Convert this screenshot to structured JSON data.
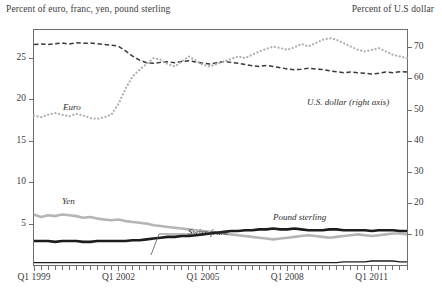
{
  "header": {
    "left_label": "Percent of euro, franc, yen, pound sterling",
    "right_label": "Percent of U.S dollar"
  },
  "axes": {
    "left_ticks": [
      "5",
      "10",
      "15",
      "20",
      "25"
    ],
    "right_ticks": [
      "10",
      "20",
      "30",
      "40",
      "50",
      "60",
      "70"
    ],
    "x_ticks": [
      "Q1 1999",
      "Q1 2002",
      "Q1 2005",
      "Q1 2008",
      "Q1 2011"
    ]
  },
  "annotations": {
    "euro": "Euro",
    "usd": "U.S. dollar (right axis)",
    "yen": "Yen",
    "swiss_franc": "Swiss franc",
    "pound_sterling": "Pound sterling"
  },
  "colors": {
    "usd": "#3a3a3a",
    "euro": "#b0b0b0",
    "yen": "#b5b5b5",
    "pound": "#1c1c1c",
    "franc": "#1c1c1c",
    "frame": "#6e6e6e",
    "text": "#3c3c3c",
    "background": "#ffffff"
  },
  "chart_data": {
    "type": "line",
    "title": "",
    "subtitle": "",
    "xlabel": "",
    "ylabel": "Percent of euro, franc, yen, pound sterling",
    "y2label": "Percent of U.S dollar",
    "grid": false,
    "legend": "inline-annotations",
    "ylim": [
      0,
      28.5
    ],
    "y2lim": [
      0,
      76
    ],
    "yticks": [
      5,
      10,
      15,
      20,
      25
    ],
    "y2ticks": [
      10,
      20,
      30,
      40,
      50,
      60,
      70
    ],
    "xlim": [
      "1999Q1",
      "2012Q2"
    ],
    "x_tick_labels": [
      "Q1 1999",
      "Q1 2002",
      "Q1 2005",
      "Q1 2008",
      "Q1 2011"
    ],
    "x_tick_positions": [
      "1999Q1",
      "2002Q1",
      "2005Q1",
      "2008Q1",
      "2011Q1"
    ],
    "x_minor_ticks": "quarterly",
    "x": [
      "1999Q1",
      "1999Q2",
      "1999Q3",
      "1999Q4",
      "2000Q1",
      "2000Q2",
      "2000Q3",
      "2000Q4",
      "2001Q1",
      "2001Q2",
      "2001Q3",
      "2001Q4",
      "2002Q1",
      "2002Q2",
      "2002Q3",
      "2002Q4",
      "2003Q1",
      "2003Q2",
      "2003Q3",
      "2003Q4",
      "2004Q1",
      "2004Q2",
      "2004Q3",
      "2004Q4",
      "2005Q1",
      "2005Q2",
      "2005Q3",
      "2005Q4",
      "2006Q1",
      "2006Q2",
      "2006Q3",
      "2006Q4",
      "2007Q1",
      "2007Q2",
      "2007Q3",
      "2007Q4",
      "2008Q1",
      "2008Q2",
      "2008Q3",
      "2008Q4",
      "2009Q1",
      "2009Q2",
      "2009Q3",
      "2009Q4",
      "2010Q1",
      "2010Q2",
      "2010Q3",
      "2010Q4",
      "2011Q1",
      "2011Q2",
      "2011Q3",
      "2011Q4",
      "2012Q1",
      "2012Q2"
    ],
    "series": [
      {
        "name": "U.S. dollar (right axis)",
        "axis": "right",
        "style": "dashed",
        "color": "#3a3a3a",
        "width": 1.5,
        "values": [
          71.0,
          71.2,
          71.0,
          71.3,
          71.5,
          71.2,
          71.6,
          71.4,
          71.5,
          71.3,
          71.0,
          70.8,
          70.5,
          69.0,
          67.3,
          66.0,
          65.2,
          65.0,
          65.3,
          65.5,
          65.2,
          65.6,
          65.8,
          65.4,
          65.0,
          64.8,
          65.2,
          65.6,
          65.3,
          65.0,
          64.6,
          64.2,
          64.0,
          64.3,
          64.0,
          63.6,
          63.2,
          62.9,
          63.1,
          63.4,
          63.2,
          63.0,
          62.6,
          62.3,
          62.0,
          62.2,
          62.0,
          61.8,
          61.6,
          61.8,
          62.2,
          62.0,
          62.3,
          62.2
        ]
      },
      {
        "name": "Euro",
        "axis": "left",
        "style": "dotted",
        "color": "#b0b0b0",
        "width": 2.2,
        "values": [
          18.1,
          17.9,
          18.2,
          18.4,
          18.2,
          18.0,
          18.3,
          18.1,
          17.8,
          17.7,
          17.9,
          18.2,
          19.5,
          21.3,
          22.8,
          23.6,
          24.3,
          25.0,
          24.8,
          24.3,
          24.0,
          24.6,
          25.2,
          24.7,
          24.2,
          24.0,
          24.3,
          24.6,
          24.9,
          25.2,
          25.0,
          25.4,
          25.8,
          26.1,
          26.4,
          26.2,
          26.0,
          26.3,
          26.7,
          26.4,
          26.8,
          27.2,
          27.4,
          27.2,
          26.8,
          26.4,
          26.0,
          25.8,
          26.0,
          26.2,
          25.8,
          25.4,
          25.2,
          25.0
        ]
      },
      {
        "name": "Yen",
        "axis": "left",
        "style": "solid",
        "color": "#b5b5b5",
        "width": 2.6,
        "values": [
          6.2,
          5.9,
          6.1,
          6.0,
          6.2,
          6.1,
          6.0,
          5.8,
          5.9,
          5.7,
          5.6,
          5.5,
          5.6,
          5.4,
          5.3,
          5.2,
          5.1,
          4.9,
          4.8,
          4.7,
          4.6,
          4.5,
          4.4,
          4.3,
          4.2,
          4.1,
          4.0,
          3.9,
          3.8,
          3.7,
          3.6,
          3.5,
          3.4,
          3.3,
          3.2,
          3.3,
          3.4,
          3.5,
          3.6,
          3.7,
          3.6,
          3.5,
          3.4,
          3.5,
          3.6,
          3.7,
          3.8,
          3.7,
          3.6,
          3.7,
          3.8,
          3.9,
          3.9,
          3.8
        ]
      },
      {
        "name": "Pound sterling",
        "axis": "left",
        "style": "solid",
        "color": "#1c1c1c",
        "width": 2.6,
        "values": [
          3.0,
          3.0,
          3.0,
          2.9,
          3.0,
          3.0,
          3.0,
          2.9,
          2.9,
          3.0,
          3.0,
          3.0,
          3.0,
          3.0,
          3.1,
          3.1,
          3.2,
          3.3,
          3.4,
          3.5,
          3.5,
          3.6,
          3.6,
          3.7,
          3.8,
          3.9,
          4.0,
          4.1,
          4.2,
          4.2,
          4.3,
          4.3,
          4.4,
          4.4,
          4.5,
          4.4,
          4.4,
          4.5,
          4.4,
          4.3,
          4.3,
          4.3,
          4.4,
          4.4,
          4.3,
          4.3,
          4.3,
          4.3,
          4.2,
          4.3,
          4.3,
          4.3,
          4.2,
          4.2
        ]
      },
      {
        "name": "Swiss franc",
        "axis": "left",
        "style": "solid",
        "color": "#1c1c1c",
        "width": 1.4,
        "values": [
          0.4,
          0.4,
          0.4,
          0.4,
          0.4,
          0.4,
          0.4,
          0.4,
          0.4,
          0.4,
          0.4,
          0.4,
          0.4,
          0.4,
          0.4,
          0.4,
          0.4,
          0.4,
          0.4,
          0.4,
          0.4,
          0.4,
          0.4,
          0.4,
          0.4,
          0.4,
          0.4,
          0.4,
          0.4,
          0.4,
          0.4,
          0.4,
          0.4,
          0.4,
          0.4,
          0.4,
          0.4,
          0.4,
          0.4,
          0.4,
          0.4,
          0.4,
          0.4,
          0.4,
          0.5,
          0.5,
          0.5,
          0.5,
          0.6,
          0.6,
          0.6,
          0.6,
          0.5,
          0.5
        ]
      }
    ]
  }
}
